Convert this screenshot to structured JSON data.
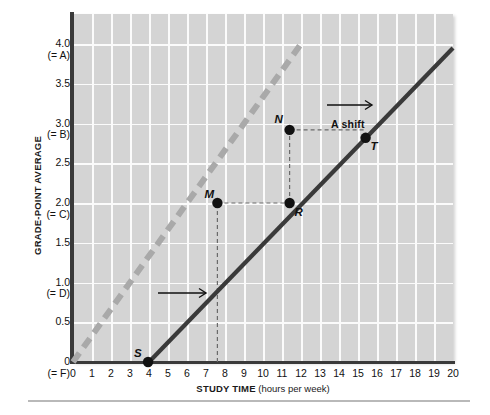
{
  "chart_data": {
    "type": "line",
    "title": "",
    "xlabel": "STUDY TIME",
    "xlabel_unit": "(hours per week)",
    "ylabel": "GRADE-POINT AVERAGE",
    "xlim": [
      0,
      20
    ],
    "ylim": [
      0,
      4.25
    ],
    "grid": true,
    "legend_position": "none",
    "x_ticks": [
      "0",
      "1",
      "2",
      "3",
      "4",
      "5",
      "6",
      "7",
      "8",
      "9",
      "10",
      "11",
      "12",
      "13",
      "14",
      "15",
      "16",
      "17",
      "18",
      "19",
      "20"
    ],
    "y_ticks": [
      {
        "value": 4.0,
        "label": "4.0",
        "sublabel": "(= A)"
      },
      {
        "value": 3.5,
        "label": "3.5",
        "sublabel": ""
      },
      {
        "value": 3.0,
        "label": "3.0",
        "sublabel": "(= B)"
      },
      {
        "value": 2.5,
        "label": "2.5",
        "sublabel": ""
      },
      {
        "value": 2.0,
        "label": "2.0",
        "sublabel": "(= C)"
      },
      {
        "value": 1.5,
        "label": "1.5",
        "sublabel": ""
      },
      {
        "value": 1.0,
        "label": "1.0",
        "sublabel": "(= D)"
      },
      {
        "value": 0.5,
        "label": "0.5",
        "sublabel": ""
      },
      {
        "value": 0.0,
        "label": "0",
        "sublabel": "(= F)"
      }
    ],
    "series": [
      {
        "name": "original curve",
        "style": "dashed",
        "color": "#a9a9a9",
        "x": [
          0,
          12.0
        ],
        "values": [
          0,
          4.0
        ]
      },
      {
        "name": "shifted curve",
        "style": "solid",
        "color": "#3a3a3a",
        "x": [
          4.0,
          20.0
        ],
        "values": [
          0,
          3.95
        ]
      }
    ],
    "points": [
      {
        "label": "M",
        "x": 7.6,
        "y": 2.0,
        "label_dx": -13,
        "label_dy": -15
      },
      {
        "label": "N",
        "x": 11.4,
        "y": 2.92,
        "label_dx": -15,
        "label_dy": -17
      },
      {
        "label": "R",
        "x": 11.4,
        "y": 2.0,
        "label_dx": 5,
        "label_dy": 3
      },
      {
        "label": "S",
        "x": 3.95,
        "y": 0.0,
        "label_dx": -14,
        "label_dy": -15
      },
      {
        "label": "T",
        "x": 15.4,
        "y": 2.82,
        "label_dx": 5,
        "label_dy": 2
      }
    ],
    "annotations": [
      {
        "name": "a-shift-label",
        "text": "A shift",
        "x": 331,
        "y": 118
      },
      {
        "name": "shift-arrow-upper",
        "text": "→",
        "x": 360,
        "y": 104
      },
      {
        "name": "shift-arrow-lower",
        "text": "→",
        "x": 185,
        "y": 292
      }
    ],
    "guide_lines": [
      {
        "name": "guide-m-to-r",
        "from": [
          7.6,
          2.0
        ],
        "to": [
          11.4,
          2.0
        ]
      },
      {
        "name": "guide-n-to-t",
        "from": [
          11.4,
          2.92
        ],
        "to": [
          15.4,
          2.92
        ]
      },
      {
        "name": "guide-vertical-m",
        "x": 7.6,
        "from_y": 0.0,
        "to_y": 2.0
      },
      {
        "name": "guide-vertical-n",
        "x": 11.4,
        "from_y": 2.0,
        "to_y": 2.92
      }
    ],
    "colors": {
      "plot_background": "#d4d4d4",
      "gridline": "#fbfbfb",
      "axis": "#3a3a3a",
      "original_curve": "#a9a9a9",
      "shifted_curve": "#3a3a3a",
      "point_marker": "#111111"
    }
  }
}
